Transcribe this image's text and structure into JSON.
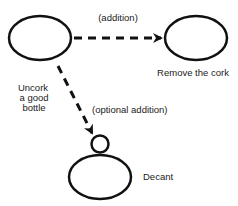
{
  "diagram": {
    "type": "use-case-relationships",
    "colors": {
      "stroke": "#111111",
      "text": "#222222",
      "background": "#ffffff"
    },
    "nodes": [
      {
        "id": "uncork",
        "label_lines": [
          "Uncork",
          "a good",
          "bottle"
        ]
      },
      {
        "id": "remove",
        "label": "Remove the cork"
      },
      {
        "id": "decant",
        "label": "Decant"
      }
    ],
    "edges": [
      {
        "from": "uncork",
        "to": "remove",
        "label": "(addition)",
        "style": "dashed-arrow"
      },
      {
        "from": "uncork",
        "to": "decant",
        "label": "(optional addition)",
        "style": "dashed-arrow",
        "end_marker": "small-circle"
      }
    ]
  }
}
